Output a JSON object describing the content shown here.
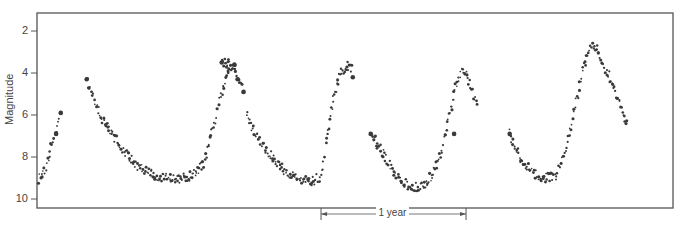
{
  "chart_data": {
    "type": "scatter",
    "title": "",
    "xlabel": "",
    "ylabel": "Magnitude",
    "y_inverted": true,
    "ylim": [
      1.5,
      10.4
    ],
    "yticks": [
      2,
      4,
      6,
      8,
      10
    ],
    "ytick_labels": [
      "2",
      "4",
      "6",
      "8",
      "10"
    ],
    "grid": false,
    "legend": null,
    "x_units": "days (relative, from left plot edge)",
    "xlim": [
      0,
      1600
    ],
    "scale_bar": {
      "label": "1 year",
      "x_start_days": 715,
      "x_end_days": 1080
    },
    "series": [
      {
        "name": "Light curve observations",
        "segments": [
          {
            "anchors": [
              [
                5,
                9.1
              ],
              [
                20,
                8.6
              ],
              [
                35,
                7.5
              ],
              [
                48,
                6.9
              ],
              [
                60,
                5.9
              ]
            ]
          },
          {
            "anchors": [
              [
                125,
                4.3
              ],
              [
                140,
                5.1
              ],
              [
                165,
                6.2
              ],
              [
                195,
                7.1
              ],
              [
                230,
                8.0
              ],
              [
                265,
                8.6
              ],
              [
                300,
                8.9
              ],
              [
                340,
                9.05
              ],
              [
                370,
                9.0
              ],
              [
                400,
                8.8
              ],
              [
                420,
                8.3
              ],
              [
                435,
                7.2
              ],
              [
                448,
                6.2
              ],
              [
                460,
                5.2
              ],
              [
                470,
                4.6
              ],
              [
                480,
                4.0
              ],
              [
                490,
                3.75
              ]
            ]
          },
          {
            "anchors": [
              [
                465,
                3.5
              ],
              [
                497,
                3.6
              ],
              [
                505,
                4.3
              ],
              [
                520,
                4.9
              ]
            ]
          },
          {
            "anchors": [
              [
                528,
                6.0
              ],
              [
                545,
                6.7
              ],
              [
                570,
                7.5
              ],
              [
                600,
                8.2
              ],
              [
                630,
                8.8
              ],
              [
                660,
                9.1
              ],
              [
                690,
                9.2
              ],
              [
                715,
                8.9
              ],
              [
                725,
                7.8
              ],
              [
                735,
                6.5
              ],
              [
                745,
                5.3
              ],
              [
                755,
                4.6
              ],
              [
                765,
                4.0
              ],
              [
                780,
                3.6
              ],
              [
                795,
                3.8
              ]
            ]
          },
          {
            "anchors": [
              [
                840,
                6.9
              ],
              [
                870,
                7.8
              ],
              [
                895,
                8.6
              ],
              [
                920,
                9.2
              ],
              [
                950,
                9.45
              ],
              [
                975,
                9.3
              ],
              [
                1000,
                8.7
              ],
              [
                1020,
                7.6
              ],
              [
                1035,
                6.3
              ],
              [
                1048,
                5.2
              ],
              [
                1058,
                4.4
              ],
              [
                1068,
                4.0
              ],
              [
                1080,
                4.1
              ],
              [
                1095,
                4.8
              ],
              [
                1110,
                5.7
              ]
            ]
          },
          {
            "anchors": [
              [
                1190,
                6.9
              ],
              [
                1215,
                8.0
              ],
              [
                1245,
                8.7
              ],
              [
                1275,
                9.0
              ],
              [
                1305,
                8.9
              ],
              [
                1320,
                8.3
              ],
              [
                1335,
                7.3
              ],
              [
                1350,
                6.0
              ],
              [
                1362,
                5.0
              ],
              [
                1373,
                4.0
              ],
              [
                1383,
                3.3
              ],
              [
                1395,
                2.7
              ],
              [
                1410,
                2.9
              ],
              [
                1425,
                3.5
              ],
              [
                1445,
                4.3
              ],
              [
                1465,
                5.3
              ],
              [
                1480,
                6.1
              ],
              [
                1485,
                6.4
              ]
            ]
          }
        ],
        "large_points": [
          [
            48,
            6.9
          ],
          [
            60,
            5.9
          ],
          [
            125,
            4.3
          ],
          [
            465,
            3.5
          ],
          [
            497,
            3.6
          ],
          [
            505,
            4.3
          ],
          [
            520,
            4.9
          ],
          [
            795,
            4.2
          ],
          [
            840,
            6.9
          ],
          [
            1190,
            6.9
          ],
          [
            1050,
            6.9
          ]
        ],
        "color": "#3a3a3a"
      }
    ]
  }
}
